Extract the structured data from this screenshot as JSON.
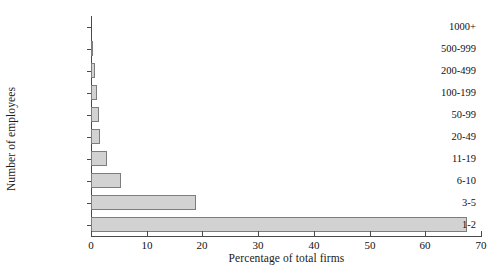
{
  "chart_data": {
    "type": "bar",
    "orientation": "horizontal",
    "title": "",
    "xlabel": "Percentage of total firms",
    "ylabel": "Number of employees",
    "categories": [
      "1-2",
      "3-5",
      "6-10",
      "11-19",
      "20-49",
      "50-99",
      "100-199",
      "200-499",
      "500-999",
      "1000+"
    ],
    "values": [
      67.5,
      18.8,
      5.4,
      2.8,
      1.7,
      1.4,
      1.1,
      0.8,
      0.4,
      0.1
    ],
    "xlim": [
      0,
      70
    ],
    "xticks": [
      0,
      10,
      20,
      30,
      40,
      50,
      60,
      70
    ],
    "xtick_labels": [
      "0",
      "10",
      "20",
      "30",
      "40",
      "50",
      "60",
      "70"
    ],
    "grid": false,
    "legend": false,
    "legend_position": "none",
    "bar_fill_color": "#d2d2d2",
    "bar_edge_color": "#7d7d7d",
    "axis_color": "#4a4a4a",
    "background_color": "#ffffff"
  }
}
